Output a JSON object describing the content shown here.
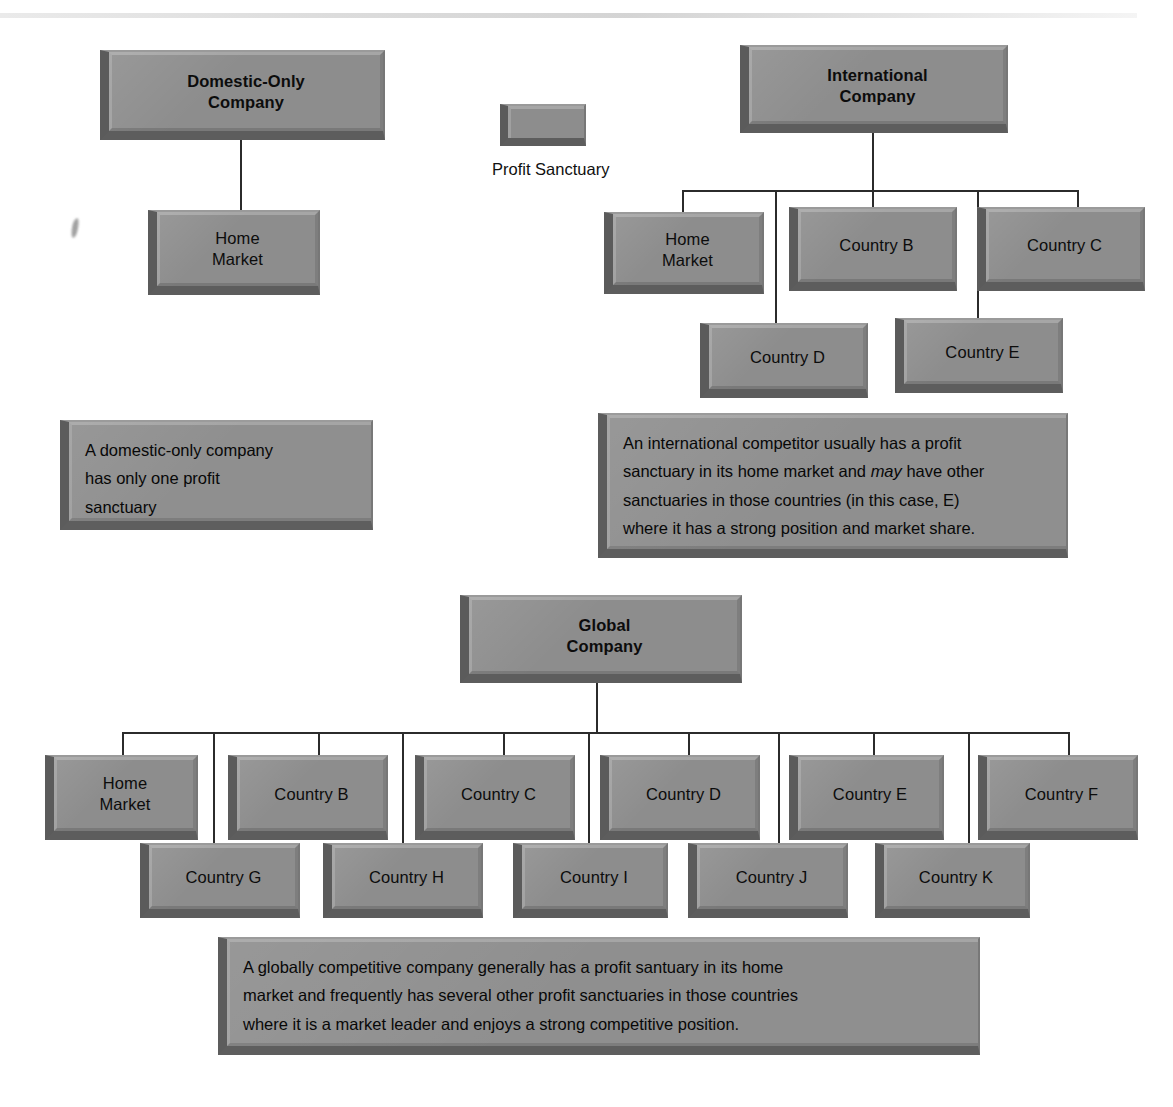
{
  "figure": {
    "legend": {
      "swatch_name": "profit-sanctuary-swatch",
      "label": "Profit Sanctuary"
    },
    "sections": [
      {
        "id": "domestic",
        "title": "Domestic-Only\nCompany",
        "title_lines": [
          "Domestic-Only",
          "Company"
        ],
        "nodes": [
          {
            "id": "dom-home",
            "label": "Home\nMarket",
            "lines": [
              "Home",
              "Market"
            ]
          }
        ],
        "caption": "A domestic-only company has only one profit sanctuary",
        "caption_lines": [
          "A domestic-only company",
          "has only one profit",
          "sanctuary"
        ]
      },
      {
        "id": "international",
        "title": "International\nCompany",
        "title_lines": [
          "International",
          "Company"
        ],
        "row1": [
          {
            "id": "intl-home",
            "label": "Home\nMarket",
            "lines": [
              "Home",
              "Market"
            ]
          },
          {
            "id": "intl-b",
            "label": "Country B",
            "lines": [
              "Country B"
            ]
          },
          {
            "id": "intl-c",
            "label": "Country C",
            "lines": [
              "Country C"
            ]
          }
        ],
        "row2": [
          {
            "id": "intl-d",
            "label": "Country D",
            "lines": [
              "Country D"
            ]
          },
          {
            "id": "intl-e",
            "label": "Country E",
            "lines": [
              "Country E"
            ]
          }
        ],
        "caption": "An international competitor usually has a profit sanctuary in its home market and may have other sanctuaries in those countries (in this case, E) where it has a strong position and market share.",
        "caption_lines": [
          "An international competitor usually has a profit",
          "sanctuary in its home market and |may| have other",
          "sanctuaries in those countries (in this case, E)",
          "where it has a strong position and market share."
        ],
        "caption_italic_word": "may"
      },
      {
        "id": "global",
        "title": "Global\nCompany",
        "title_lines": [
          "Global",
          "Company"
        ],
        "row1": [
          {
            "id": "glb-home",
            "label": "Home\nMarket",
            "lines": [
              "Home",
              "Market"
            ]
          },
          {
            "id": "glb-b",
            "label": "Country B",
            "lines": [
              "Country B"
            ]
          },
          {
            "id": "glb-c",
            "label": "Country C",
            "lines": [
              "Country C"
            ]
          },
          {
            "id": "glb-d",
            "label": "Country D",
            "lines": [
              "Country D"
            ]
          },
          {
            "id": "glb-e",
            "label": "Country E",
            "lines": [
              "Country E"
            ]
          },
          {
            "id": "glb-f",
            "label": "Country F",
            "lines": [
              "Country F"
            ]
          }
        ],
        "row2": [
          {
            "id": "glb-g",
            "label": "Country G",
            "lines": [
              "Country G"
            ]
          },
          {
            "id": "glb-h",
            "label": "Country H",
            "lines": [
              "Country H"
            ]
          },
          {
            "id": "glb-i",
            "label": "Country I",
            "lines": [
              "Country I"
            ]
          },
          {
            "id": "glb-j",
            "label": "Country J",
            "lines": [
              "Country J"
            ]
          },
          {
            "id": "glb-k",
            "label": "Country K",
            "lines": [
              "Country K"
            ]
          }
        ],
        "caption": "A globally competitive company generally has a profit santuary in its home market and frequently has several other profit sanctuaries in those countries where it is a market leader and enjoys a strong competitive position.",
        "caption_lines": [
          "A globally competitive company generally has a profit santuary in its home",
          "market and frequently has several other profit sanctuaries in those countries",
          "where it is a market leader and enjoys a strong competitive position."
        ]
      }
    ],
    "colors": {
      "box_face": "#8d8d8d",
      "box_shadow_edge": "#5b5b5b",
      "connector": "#2b2b2b",
      "text": "#0c0c0c",
      "background": "#ffffff"
    }
  },
  "text": {
    "domestic_title_l1": "Domestic-Only",
    "domestic_title_l2": "Company",
    "domestic_home_l1": "Home",
    "domestic_home_l2": "Market",
    "domestic_caption_l1": "A domestic-only company",
    "domestic_caption_l2": "has only one profit",
    "domestic_caption_l3": "sanctuary",
    "legend_label": "Profit Sanctuary",
    "intl_title_l1": "International",
    "intl_title_l2": "Company",
    "intl_home_l1": "Home",
    "intl_home_l2": "Market",
    "intl_b": "Country B",
    "intl_c": "Country C",
    "intl_d": "Country D",
    "intl_e": "Country E",
    "intl_cap_l1": "An international competitor usually has a profit",
    "intl_cap_l2a": "sanctuary in its home market and ",
    "intl_cap_l2_italic": "may",
    "intl_cap_l2b": " have other",
    "intl_cap_l3": "sanctuaries in those countries (in this case, E)",
    "intl_cap_l4": "where it has a strong position and market share.",
    "global_title_l1": "Global",
    "global_title_l2": "Company",
    "global_home_l1": "Home",
    "global_home_l2": "Market",
    "global_b": "Country B",
    "global_c": "Country C",
    "global_d": "Country D",
    "global_e": "Country E",
    "global_f": "Country F",
    "global_g": "Country G",
    "global_h": "Country H",
    "global_i": "Country I",
    "global_j": "Country J",
    "global_k": "Country K",
    "global_cap_l1": "A globally competitive company generally has a profit santuary in its home",
    "global_cap_l2": "market and frequently has several other profit sanctuaries in those countries",
    "global_cap_l3": "where it is a market leader and enjoys a strong competitive position."
  }
}
